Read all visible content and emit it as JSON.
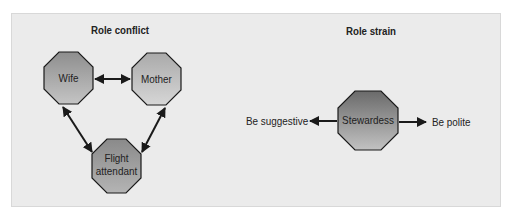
{
  "diagram": {
    "role_conflict": {
      "title": "Role conflict",
      "nodes": [
        {
          "id": "wife",
          "label": "Wife"
        },
        {
          "id": "mother",
          "label": "Mother"
        },
        {
          "id": "flight_attendant",
          "label_line1": "Flight",
          "label_line2": "attendant"
        }
      ],
      "edges": [
        {
          "from": "wife",
          "to": "mother",
          "type": "bidirectional"
        },
        {
          "from": "wife",
          "to": "flight_attendant",
          "type": "bidirectional"
        },
        {
          "from": "mother",
          "to": "flight_attendant",
          "type": "bidirectional"
        }
      ]
    },
    "role_strain": {
      "title": "Role strain",
      "center": {
        "id": "stewardess",
        "label": "Stewardess"
      },
      "left": {
        "label": "Be suggestive"
      },
      "right": {
        "label": "Be polite"
      }
    },
    "colors": {
      "panel_bg": "#ebebeb",
      "node_light": "#bdbdbd",
      "node_dark": "#7a7a7a",
      "outline": "#1a1a1a"
    }
  }
}
